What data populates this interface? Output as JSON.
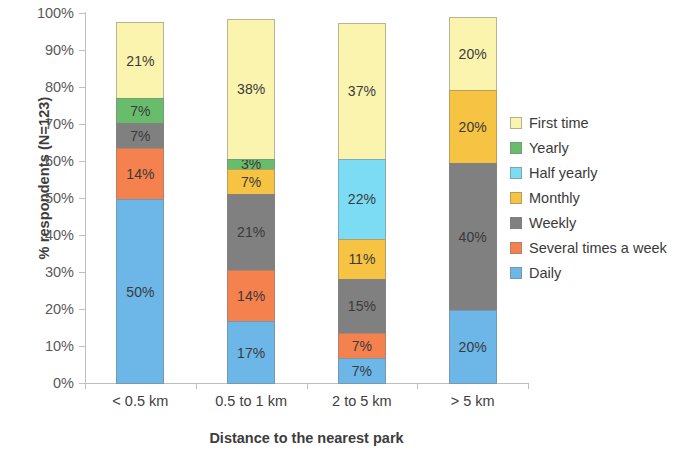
{
  "chart_data": {
    "type": "bar",
    "subtype": "stacked-100-percent",
    "title": "",
    "xlabel": "Distance to the nearest park",
    "ylabel": "% respondents (N=123)",
    "categories": [
      "< 0.5 km",
      "0.5 to 1 km",
      "2 to 5 km",
      "> 5 km"
    ],
    "ylim": [
      0,
      100
    ],
    "ytick_labels": [
      "100%",
      "90%",
      "80%",
      "70%",
      "60%",
      "50%",
      "40%",
      "30%",
      "20%",
      "10%",
      "0%"
    ],
    "ytick_values": [
      100,
      90,
      80,
      70,
      60,
      50,
      40,
      30,
      20,
      10,
      0
    ],
    "grid": false,
    "legend_position": "right",
    "series": [
      {
        "name": "First time",
        "color": "#fbf4ae",
        "values": [
          21,
          38,
          37,
          20
        ],
        "labels": [
          "21%",
          "38%",
          "37%",
          "20%"
        ]
      },
      {
        "name": "Yearly",
        "color": "#68bd6d",
        "values": [
          7,
          3,
          0,
          0
        ],
        "labels": [
          "7%",
          "3%",
          "",
          ""
        ]
      },
      {
        "name": "Half yearly",
        "color": "#7cdcf3",
        "values": [
          0,
          0,
          22,
          0
        ],
        "labels": [
          "",
          "",
          "22%",
          ""
        ]
      },
      {
        "name": "Monthly",
        "color": "#f6c342",
        "values": [
          0,
          7,
          11,
          20
        ],
        "labels": [
          "",
          "7%",
          "11%",
          "20%"
        ]
      },
      {
        "name": "Weekly",
        "color": "#808080",
        "values": [
          7,
          21,
          15,
          40
        ],
        "labels": [
          "7%",
          "21%",
          "15%",
          "40%"
        ]
      },
      {
        "name": "Several times a week",
        "color": "#f5814f",
        "values": [
          14,
          14,
          7,
          0
        ],
        "labels": [
          "14%",
          "14%",
          "7%",
          ""
        ]
      },
      {
        "name": "Daily",
        "color": "#6cb6e8",
        "values": [
          50,
          17,
          7,
          20
        ],
        "labels": [
          "50%",
          "17%",
          "7%",
          "20%"
        ]
      }
    ]
  },
  "legend": {
    "items": [
      {
        "label": "First time",
        "color": "#fbf4ae"
      },
      {
        "label": "Yearly",
        "color": "#68bd6d"
      },
      {
        "label": "Half yearly",
        "color": "#7cdcf3"
      },
      {
        "label": "Monthly",
        "color": "#f6c342"
      },
      {
        "label": "Weekly",
        "color": "#808080"
      },
      {
        "label": "Several times a week",
        "color": "#f5814f"
      },
      {
        "label": "Daily",
        "color": "#6cb6e8"
      }
    ]
  }
}
